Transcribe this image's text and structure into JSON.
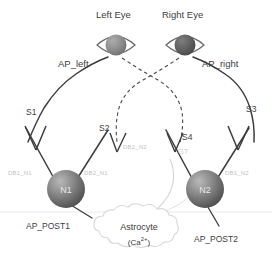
{
  "figure": {
    "title_visible": false,
    "background": "#ffffff"
  },
  "eyes": [
    {
      "label": "Left Eye",
      "name": "left-eye",
      "pupil_color": "#8c8c8c"
    },
    {
      "label": "Right Eye",
      "name": "right-eye",
      "pupil_color": "#5f5f5f"
    }
  ],
  "action_potentials": {
    "left": "AP_left",
    "right": "AP_right",
    "post1": "AP_POST1",
    "post2": "AP_POST2"
  },
  "synapses": [
    {
      "id": "S1",
      "label": "S1"
    },
    {
      "id": "S2",
      "label": "S2"
    },
    {
      "id": "S3",
      "label": "S3"
    },
    {
      "id": "S4",
      "label": "S4"
    }
  ],
  "dendrite_labels": [
    {
      "id": "DB1_N1",
      "label": "DB1_N1"
    },
    {
      "id": "DB2_N1",
      "label": "DB2_N1"
    },
    {
      "id": "DB2_N2",
      "label": "DB2_N2"
    },
    {
      "id": "DB1_N2",
      "label": "DB1_N2"
    }
  ],
  "gliotransmitter": {
    "label": "GT"
  },
  "neurons": [
    {
      "id": "N1",
      "label": "N1"
    },
    {
      "id": "N2",
      "label": "N2"
    }
  ],
  "astrocyte": {
    "name": "Astrocyte",
    "ion": "(Ca",
    "ion_sup": "2+",
    "ion_close": ")"
  },
  "colors": {
    "line_dark": "#3d3d3d",
    "line_faint": "#cfcfcf",
    "node_fill": "#6e6e6e",
    "pupil_left": "#8c8c8c",
    "pupil_right": "#5f5f5f",
    "text": "#3d3d3d",
    "text_faint": "#c3c3c3"
  }
}
